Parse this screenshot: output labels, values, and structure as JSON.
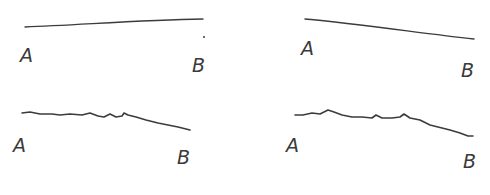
{
  "figure": {
    "stroke_color": "#3c3c3c",
    "background": "#ffffff",
    "panels": [
      {
        "id": "top-left",
        "style": "smooth, nearly straight, slightly rising",
        "start_label": "A",
        "end_label": "B",
        "path": "M25,27 C80,25 140,20 203,19",
        "label_a": {
          "x": 20,
          "y": 62
        },
        "label_b": {
          "x": 192,
          "y": 72
        },
        "extra_dot": {
          "x": 204,
          "y": 37
        }
      },
      {
        "id": "top-right",
        "style": "smooth, gently descending",
        "start_label": "A",
        "end_label": "B",
        "path": "M305,19 C360,24 420,33 474,39",
        "label_a": {
          "x": 301,
          "y": 55
        },
        "label_b": {
          "x": 461,
          "y": 77
        }
      },
      {
        "id": "bottom-left",
        "style": "jagged, wavy",
        "start_label": "A",
        "end_label": "B",
        "path": "M22,113 L30,112 L40,114 L52,114 L60,115 L70,114 L82,115 L90,113 L98,116 L104,117 L110,114 L116,117 L122,116 L124,113 L128,115 L136,117 L146,120 L158,123 L168,125 L178,127 L190,130",
        "label_a": {
          "x": 13,
          "y": 152
        },
        "label_b": {
          "x": 177,
          "y": 164
        }
      },
      {
        "id": "bottom-right",
        "style": "jagged, wavy, descending at end",
        "start_label": "A",
        "end_label": "B",
        "path": "M295,115 L303,115 L312,113 L320,114 L328,110 L334,112 L342,115 L352,117 L362,117 L372,118 L376,115 L382,118 L392,118 L400,117 L404,114 L410,118 L420,120 L430,125 L442,128 L450,130 L460,133 L468,136 L473,136",
        "label_a": {
          "x": 286,
          "y": 152
        },
        "label_b": {
          "x": 463,
          "y": 168
        }
      }
    ]
  }
}
